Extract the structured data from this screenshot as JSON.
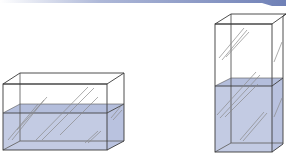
{
  "diagram": {
    "colors": {
      "header_bar": "#7f8fbf",
      "water": "#c3cbe3",
      "water_top": "#b4bedc",
      "edge": "#3a3a3a",
      "glare": "#9a9a9a"
    },
    "tanks": [
      {
        "name": "wide-tank",
        "shape": "wide and short",
        "water_level": "about half"
      },
      {
        "name": "tall-tank",
        "shape": "narrow and tall",
        "water_level": "about half"
      }
    ]
  }
}
